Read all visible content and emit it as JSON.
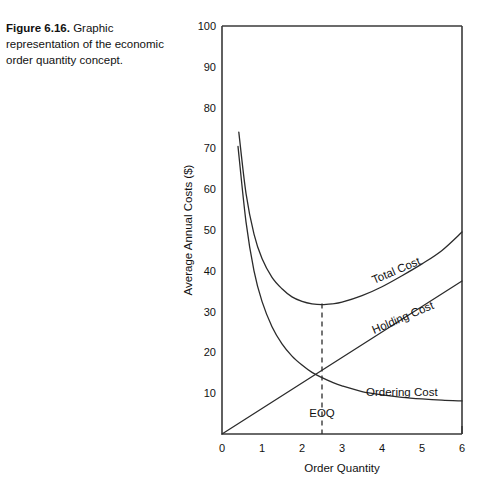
{
  "caption": {
    "figure_number": "Figure 6.16.",
    "text": "Graphic representation of the economic order quantity concept."
  },
  "chart_data": {
    "type": "line",
    "title": "",
    "xlabel": "Order Quantity",
    "ylabel": "Average Annual Costs ($)",
    "xlim": [
      0,
      6
    ],
    "ylim": [
      0,
      100
    ],
    "xticks": [
      "0",
      "1",
      "2",
      "3",
      "4",
      "5",
      "6"
    ],
    "yticks": [
      "0",
      "10",
      "20",
      "30",
      "40",
      "50",
      "60",
      "70",
      "80",
      "90",
      "100"
    ],
    "grid": false,
    "legend_position": "inline-labels",
    "series": [
      {
        "name": "Total Cost",
        "label": "Total Cost",
        "x": [
          0.42,
          0.6,
          0.8,
          1.0,
          1.25,
          1.5,
          1.75,
          2.0,
          2.25,
          2.5,
          2.75,
          3.0,
          3.5,
          4.0,
          4.5,
          5.0,
          5.5,
          6.0
        ],
        "y": [
          74.0,
          59.0,
          49.0,
          43.0,
          38.4,
          35.6,
          33.6,
          32.5,
          31.9,
          31.7,
          31.9,
          32.3,
          33.9,
          36.1,
          38.8,
          41.7,
          45.0,
          49.5
        ]
      },
      {
        "name": "Ordering Cost",
        "label": "Ordering Cost",
        "x": [
          0.4,
          0.6,
          0.8,
          1.0,
          1.25,
          1.5,
          1.75,
          2.0,
          2.25,
          2.5,
          2.75,
          3.0,
          3.5,
          4.0,
          4.5,
          5.0,
          5.5,
          6.0
        ],
        "y": [
          70.5,
          52.0,
          40.0,
          32.5,
          26.3,
          22.1,
          19.1,
          16.9,
          15.1,
          13.8,
          12.7,
          11.8,
          10.4,
          9.6,
          9.0,
          8.6,
          8.3,
          8.1
        ]
      },
      {
        "name": "Holding Cost",
        "label": "Holding Cost",
        "x": [
          0,
          6
        ],
        "y": [
          0,
          37.5
        ]
      }
    ],
    "annotations": [
      {
        "name": "eoq-marker",
        "label": "EOQ",
        "x": 2.5,
        "line_y_top": 32.0,
        "line_y_bottom": 0
      }
    ]
  }
}
